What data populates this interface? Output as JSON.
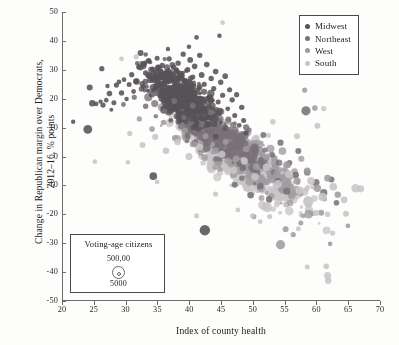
{
  "chart_data": {
    "type": "scatter",
    "title": "",
    "xlabel": "Index of county health",
    "ylabel": "Change in Republican margin over Democrats,\n2012–16, % points",
    "xlim": [
      20,
      70
    ],
    "ylim": [
      -50,
      50
    ],
    "xticks": [
      20,
      25,
      30,
      35,
      40,
      45,
      50,
      55,
      60,
      65,
      70
    ],
    "yticks": [
      50,
      40,
      30,
      20,
      10,
      0,
      -10,
      -20,
      -30,
      -40,
      -50
    ],
    "grid": false,
    "legend_position": "top-right",
    "size_encoding": {
      "label": "Voting-age citizens",
      "large_label": "500,00",
      "small_label": "5000",
      "large_value": 500000,
      "small_value": 5000
    },
    "series": [
      {
        "name": "Midwest",
        "color": "#575257",
        "n_points": 620
      },
      {
        "name": "Northeast",
        "color": "#787278",
        "n_points": 310
      },
      {
        "name": "West",
        "color": "#a09ba0",
        "n_points": 330
      },
      {
        "name": "South",
        "color": "#c8c5c6",
        "n_points": 740
      }
    ],
    "annotations": [
      {
        "text": "Dark Midwest outlier",
        "x": 42.3,
        "y": -25.5
      },
      {
        "text": "Light South outlier high",
        "x": 45.1,
        "y": 46.3
      },
      {
        "text": "Light South outliers low right",
        "x": 61.5,
        "y": -41.0
      }
    ],
    "points": [
      {
        "s": 0,
        "x": 21.6,
        "y": 12.0,
        "r": 2.2
      },
      {
        "s": 0,
        "x": 23.9,
        "y": 9.4,
        "r": 4.4
      },
      {
        "s": 0,
        "x": 24.2,
        "y": 23.9,
        "r": 3.0
      },
      {
        "s": 0,
        "x": 24.6,
        "y": 18.4,
        "r": 3.2
      },
      {
        "s": 0,
        "x": 25.2,
        "y": 18.2,
        "r": 2.4
      },
      {
        "s": 0,
        "x": 25.9,
        "y": 19.0,
        "r": 2.2
      },
      {
        "s": 0,
        "x": 26.3,
        "y": 17.8,
        "r": 2.6
      },
      {
        "s": 0,
        "x": 26.8,
        "y": 19.5,
        "r": 2.3
      },
      {
        "s": 0,
        "x": 27.3,
        "y": 21.8,
        "r": 2.8
      },
      {
        "s": 0,
        "x": 27.6,
        "y": 16.2,
        "r": 2.0
      },
      {
        "s": 0,
        "x": 28.0,
        "y": 18.6,
        "r": 2.5
      },
      {
        "s": 0,
        "x": 28.4,
        "y": 24.7,
        "r": 2.6
      },
      {
        "s": 0,
        "x": 26.1,
        "y": 30.4,
        "r": 2.6
      },
      {
        "s": 0,
        "x": 27.0,
        "y": 24.4,
        "r": 2.2
      },
      {
        "s": 0,
        "x": 28.8,
        "y": 25.8,
        "r": 2.4
      },
      {
        "s": 0,
        "x": 29.2,
        "y": 22.0,
        "r": 2.7
      },
      {
        "s": 0,
        "x": 29.6,
        "y": 26.6,
        "r": 2.3
      },
      {
        "s": 0,
        "x": 30.0,
        "y": 19.9,
        "r": 2.2
      },
      {
        "s": 0,
        "x": 30.4,
        "y": 24.9,
        "r": 2.5
      },
      {
        "s": 0,
        "x": 30.8,
        "y": 28.3,
        "r": 2.6
      },
      {
        "s": 0,
        "x": 31.1,
        "y": 22.5,
        "r": 2.4
      },
      {
        "s": 0,
        "x": 31.5,
        "y": 26.0,
        "r": 2.8
      },
      {
        "s": 0,
        "x": 31.9,
        "y": 31.0,
        "r": 2.5
      },
      {
        "s": 0,
        "x": 32.2,
        "y": 35.8,
        "r": 3.0
      },
      {
        "s": 0,
        "x": 32.6,
        "y": 24.2,
        "r": 2.5
      },
      {
        "s": 0,
        "x": 33.0,
        "y": 28.9,
        "r": 2.7
      },
      {
        "s": 0,
        "x": 33.4,
        "y": 33.1,
        "r": 2.6
      },
      {
        "s": 0,
        "x": 33.7,
        "y": 26.4,
        "r": 2.9
      },
      {
        "s": 0,
        "x": 34.1,
        "y": 30.2,
        "r": 2.6
      },
      {
        "s": 0,
        "x": 34.5,
        "y": 22.7,
        "r": 2.4
      },
      {
        "s": 0,
        "x": 34.8,
        "y": 34.0,
        "r": 2.5
      },
      {
        "s": 0,
        "x": 35.2,
        "y": 28.0,
        "r": 2.8
      },
      {
        "s": 0,
        "x": 35.6,
        "y": 31.5,
        "r": 2.7
      },
      {
        "s": 0,
        "x": 35.9,
        "y": 25.3,
        "r": 2.6
      },
      {
        "s": 0,
        "x": 36.3,
        "y": 29.1,
        "r": 2.9
      },
      {
        "s": 0,
        "x": 36.7,
        "y": 33.8,
        "r": 2.6
      },
      {
        "s": 0,
        "x": 37.0,
        "y": 27.2,
        "r": 2.7
      },
      {
        "s": 0,
        "x": 37.4,
        "y": 30.9,
        "r": 2.8
      },
      {
        "s": 0,
        "x": 37.8,
        "y": 24.0,
        "r": 2.5
      },
      {
        "s": 0,
        "x": 38.1,
        "y": 32.3,
        "r": 2.7
      },
      {
        "s": 0,
        "x": 38.5,
        "y": 28.6,
        "r": 3.0
      },
      {
        "s": 0,
        "x": 38.9,
        "y": 35.4,
        "r": 2.6
      },
      {
        "s": 0,
        "x": 39.2,
        "y": 26.1,
        "r": 2.8
      },
      {
        "s": 0,
        "x": 39.6,
        "y": 30.0,
        "r": 2.7
      },
      {
        "s": 0,
        "x": 40.0,
        "y": 33.4,
        "r": 2.9
      },
      {
        "s": 0,
        "x": 40.4,
        "y": 27.5,
        "r": 2.6
      },
      {
        "s": 0,
        "x": 40.7,
        "y": 31.2,
        "r": 2.8
      },
      {
        "s": 0,
        "x": 41.1,
        "y": 22.9,
        "r": 2.5
      },
      {
        "s": 0,
        "x": 41.5,
        "y": 35.0,
        "r": 2.7
      },
      {
        "s": 0,
        "x": 41.8,
        "y": 28.2,
        "r": 2.9
      },
      {
        "s": 0,
        "x": 42.2,
        "y": 25.0,
        "r": 2.6
      },
      {
        "s": 0,
        "x": 42.6,
        "y": 31.8,
        "r": 2.8
      },
      {
        "s": 0,
        "x": 42.9,
        "y": 20.4,
        "r": 2.5
      },
      {
        "s": 0,
        "x": 43.3,
        "y": 27.0,
        "r": 2.7
      },
      {
        "s": 0,
        "x": 43.7,
        "y": 23.5,
        "r": 2.6
      },
      {
        "s": 0,
        "x": 44.0,
        "y": 29.4,
        "r": 2.8
      },
      {
        "s": 0,
        "x": 44.4,
        "y": 18.9,
        "r": 2.5
      },
      {
        "s": 0,
        "x": 44.8,
        "y": 25.7,
        "r": 2.7
      },
      {
        "s": 0,
        "x": 45.1,
        "y": 21.2,
        "r": 2.6
      },
      {
        "s": 0,
        "x": 45.5,
        "y": 27.8,
        "r": 2.8
      },
      {
        "s": 0,
        "x": 45.9,
        "y": 16.5,
        "r": 2.4
      },
      {
        "s": 0,
        "x": 46.2,
        "y": 23.1,
        "r": 2.6
      },
      {
        "s": 0,
        "x": 46.6,
        "y": 19.6,
        "r": 2.7
      },
      {
        "s": 0,
        "x": 47.0,
        "y": 14.2,
        "r": 2.5
      },
      {
        "s": 0,
        "x": 47.3,
        "y": 21.4,
        "r": 2.6
      },
      {
        "s": 0,
        "x": 47.7,
        "y": 10.8,
        "r": 2.4
      },
      {
        "s": 0,
        "x": 48.1,
        "y": 17.0,
        "r": 2.7
      },
      {
        "s": 0,
        "x": 48.4,
        "y": 12.5,
        "r": 2.5
      },
      {
        "s": 0,
        "x": 48.8,
        "y": 8.2,
        "r": 2.6
      },
      {
        "s": 0,
        "x": 42.3,
        "y": -25.5,
        "r": 5.2
      },
      {
        "s": 0,
        "x": 34.2,
        "y": -6.8,
        "r": 3.8
      },
      {
        "s": 0,
        "x": 41.0,
        "y": 41.2,
        "r": 2.4
      },
      {
        "s": 0,
        "x": 44.6,
        "y": 41.8,
        "r": 2.3
      },
      {
        "s": 0,
        "x": 39.8,
        "y": 38.0,
        "r": 2.3
      },
      {
        "s": 0,
        "x": 36.5,
        "y": 37.2,
        "r": 2.2
      },
      {
        "s": 1,
        "x": 29.5,
        "y": 18.0,
        "r": 2.4
      },
      {
        "s": 1,
        "x": 31.2,
        "y": 20.5,
        "r": 2.6
      },
      {
        "s": 1,
        "x": 33.0,
        "y": 17.4,
        "r": 2.7
      },
      {
        "s": 1,
        "x": 34.6,
        "y": 21.9,
        "r": 2.8
      },
      {
        "s": 1,
        "x": 36.0,
        "y": 15.8,
        "r": 2.6
      },
      {
        "s": 1,
        "x": 37.5,
        "y": 19.2,
        "r": 2.9
      },
      {
        "s": 1,
        "x": 39.0,
        "y": 13.5,
        "r": 2.7
      },
      {
        "s": 1,
        "x": 40.4,
        "y": 17.6,
        "r": 3.0
      },
      {
        "s": 1,
        "x": 41.8,
        "y": 11.0,
        "r": 2.8
      },
      {
        "s": 1,
        "x": 43.2,
        "y": 15.3,
        "r": 2.9
      },
      {
        "s": 1,
        "x": 44.6,
        "y": 8.4,
        "r": 2.7
      },
      {
        "s": 1,
        "x": 46.0,
        "y": 12.8,
        "r": 3.0
      },
      {
        "s": 1,
        "x": 47.4,
        "y": 5.9,
        "r": 2.8
      },
      {
        "s": 1,
        "x": 48.8,
        "y": 10.1,
        "r": 3.1
      },
      {
        "s": 1,
        "x": 50.2,
        "y": 3.2,
        "r": 2.9
      },
      {
        "s": 1,
        "x": 51.5,
        "y": 7.4,
        "r": 3.0
      },
      {
        "s": 1,
        "x": 52.9,
        "y": 0.6,
        "r": 2.8
      },
      {
        "s": 1,
        "x": 54.2,
        "y": 4.8,
        "r": 3.1
      },
      {
        "s": 1,
        "x": 55.6,
        "y": -2.2,
        "r": 2.9
      },
      {
        "s": 1,
        "x": 57.0,
        "y": 1.9,
        "r": 3.0
      },
      {
        "s": 1,
        "x": 58.2,
        "y": 15.8,
        "r": 4.6
      },
      {
        "s": 1,
        "x": 58.4,
        "y": -5.5,
        "r": 3.2
      },
      {
        "s": 1,
        "x": 59.8,
        "y": -9.0,
        "r": 3.4
      },
      {
        "s": 1,
        "x": 61.0,
        "y": -12.5,
        "r": 3.6
      },
      {
        "s": 1,
        "x": 62.2,
        "y": -8.0,
        "r": 3.0
      },
      {
        "s": 1,
        "x": 63.0,
        "y": -16.0,
        "r": 2.8
      },
      {
        "s": 1,
        "x": 49.5,
        "y": -13.4,
        "r": 3.3
      },
      {
        "s": 1,
        "x": 51.0,
        "y": -10.2,
        "r": 3.4
      },
      {
        "s": 1,
        "x": 52.4,
        "y": -14.8,
        "r": 3.2
      },
      {
        "s": 1,
        "x": 53.8,
        "y": -8.6,
        "r": 3.3
      },
      {
        "s": 1,
        "x": 55.2,
        "y": -12.0,
        "r": 3.5
      },
      {
        "s": 1,
        "x": 56.6,
        "y": -6.4,
        "r": 3.2
      },
      {
        "s": 1,
        "x": 47.0,
        "y": -9.8,
        "r": 3.0
      },
      {
        "s": 2,
        "x": 32.0,
        "y": 13.0,
        "r": 2.6
      },
      {
        "s": 2,
        "x": 34.0,
        "y": 9.5,
        "r": 2.8
      },
      {
        "s": 2,
        "x": 35.8,
        "y": 11.8,
        "r": 2.7
      },
      {
        "s": 2,
        "x": 37.6,
        "y": 6.4,
        "r": 3.0
      },
      {
        "s": 2,
        "x": 39.2,
        "y": 9.0,
        "r": 2.9
      },
      {
        "s": 2,
        "x": 40.8,
        "y": 4.2,
        "r": 3.1
      },
      {
        "s": 2,
        "x": 42.4,
        "y": 7.0,
        "r": 3.0
      },
      {
        "s": 2,
        "x": 44.0,
        "y": 2.0,
        "r": 3.2
      },
      {
        "s": 2,
        "x": 45.6,
        "y": 5.1,
        "r": 3.1
      },
      {
        "s": 2,
        "x": 47.2,
        "y": -0.8,
        "r": 3.3
      },
      {
        "s": 2,
        "x": 48.8,
        "y": 2.6,
        "r": 3.2
      },
      {
        "s": 2,
        "x": 50.4,
        "y": -3.5,
        "r": 3.4
      },
      {
        "s": 2,
        "x": 52.0,
        "y": -0.2,
        "r": 3.3
      },
      {
        "s": 2,
        "x": 53.6,
        "y": -6.0,
        "r": 3.5
      },
      {
        "s": 2,
        "x": 55.2,
        "y": -2.8,
        "r": 3.4
      },
      {
        "s": 2,
        "x": 56.8,
        "y": -8.5,
        "r": 3.6
      },
      {
        "s": 2,
        "x": 58.4,
        "y": -5.0,
        "r": 3.5
      },
      {
        "s": 2,
        "x": 60.0,
        "y": -11.0,
        "r": 3.7
      },
      {
        "s": 2,
        "x": 61.6,
        "y": -7.5,
        "r": 3.4
      },
      {
        "s": 2,
        "x": 63.2,
        "y": -13.2,
        "r": 3.2
      },
      {
        "s": 2,
        "x": 58.0,
        "y": 23.0,
        "r": 2.6
      },
      {
        "s": 2,
        "x": 59.6,
        "y": 16.8,
        "r": 2.8
      },
      {
        "s": 2,
        "x": 54.2,
        "y": -30.5,
        "r": 4.6
      },
      {
        "s": 2,
        "x": 55.0,
        "y": -25.2,
        "r": 3.0
      },
      {
        "s": 2,
        "x": 56.2,
        "y": -27.0,
        "r": 2.6
      },
      {
        "s": 2,
        "x": 57.4,
        "y": -23.0,
        "r": 2.5
      },
      {
        "s": 2,
        "x": 50.0,
        "y": -20.8,
        "r": 2.6
      },
      {
        "s": 2,
        "x": 62.0,
        "y": -30.2,
        "r": 2.4
      },
      {
        "s": 2,
        "x": 60.6,
        "y": -19.5,
        "r": 3.0
      },
      {
        "s": 2,
        "x": 64.8,
        "y": -24.0,
        "r": 2.4
      },
      {
        "s": 3,
        "x": 30.5,
        "y": 8.0,
        "r": 2.6
      },
      {
        "s": 3,
        "x": 32.5,
        "y": 4.0,
        "r": 2.9
      },
      {
        "s": 3,
        "x": 34.5,
        "y": 6.8,
        "r": 3.1
      },
      {
        "s": 3,
        "x": 36.2,
        "y": 2.0,
        "r": 3.3
      },
      {
        "s": 3,
        "x": 38.0,
        "y": 5.0,
        "r": 3.2
      },
      {
        "s": 3,
        "x": 39.8,
        "y": 0.0,
        "r": 3.5
      },
      {
        "s": 3,
        "x": 41.5,
        "y": 3.2,
        "r": 3.4
      },
      {
        "s": 3,
        "x": 43.2,
        "y": -2.5,
        "r": 3.6
      },
      {
        "s": 3,
        "x": 45.0,
        "y": 0.8,
        "r": 3.5
      },
      {
        "s": 3,
        "x": 46.8,
        "y": -4.8,
        "r": 3.7
      },
      {
        "s": 3,
        "x": 48.5,
        "y": -1.5,
        "r": 3.6
      },
      {
        "s": 3,
        "x": 50.2,
        "y": -7.0,
        "r": 3.8
      },
      {
        "s": 3,
        "x": 52.0,
        "y": -3.8,
        "r": 3.7
      },
      {
        "s": 3,
        "x": 53.8,
        "y": -9.5,
        "r": 3.9
      },
      {
        "s": 3,
        "x": 55.5,
        "y": -6.2,
        "r": 3.8
      },
      {
        "s": 3,
        "x": 57.2,
        "y": -11.8,
        "r": 4.0
      },
      {
        "s": 3,
        "x": 59.0,
        "y": -8.4,
        "r": 3.9
      },
      {
        "s": 3,
        "x": 60.8,
        "y": -14.0,
        "r": 4.1
      },
      {
        "s": 3,
        "x": 62.5,
        "y": -10.5,
        "r": 3.8
      },
      {
        "s": 3,
        "x": 64.2,
        "y": -15.0,
        "r": 3.4
      },
      {
        "s": 3,
        "x": 66.0,
        "y": -11.0,
        "r": 4.2
      },
      {
        "s": 3,
        "x": 66.8,
        "y": -11.2,
        "r": 3.6
      },
      {
        "s": 3,
        "x": 45.1,
        "y": 46.3,
        "r": 2.4
      },
      {
        "s": 3,
        "x": 31.5,
        "y": 34.5,
        "r": 2.6
      },
      {
        "s": 3,
        "x": 29.2,
        "y": 33.8,
        "r": 2.4
      },
      {
        "s": 3,
        "x": 61.4,
        "y": -38.0,
        "r": 2.8
      },
      {
        "s": 3,
        "x": 61.6,
        "y": -41.2,
        "r": 3.6
      },
      {
        "s": 3,
        "x": 61.7,
        "y": -43.0,
        "r": 3.2
      },
      {
        "s": 3,
        "x": 58.4,
        "y": -38.2,
        "r": 2.5
      },
      {
        "s": 3,
        "x": 59.8,
        "y": -19.5,
        "r": 3.2
      },
      {
        "s": 3,
        "x": 61.6,
        "y": -20.0,
        "r": 2.8
      },
      {
        "s": 3,
        "x": 47.5,
        "y": -18.5,
        "r": 2.4
      },
      {
        "s": 3,
        "x": 49.8,
        "y": -20.5,
        "r": 2.5
      },
      {
        "s": 3,
        "x": 25.0,
        "y": -1.8,
        "r": 2.4
      },
      {
        "s": 3,
        "x": 30.2,
        "y": -2.0,
        "r": 2.3
      },
      {
        "s": 3,
        "x": 34.8,
        "y": -8.8,
        "r": 2.4
      },
      {
        "s": 3,
        "x": 41.0,
        "y": -20.5,
        "r": 2.6
      },
      {
        "s": 3,
        "x": 55.0,
        "y": -16.8,
        "r": 2.4
      },
      {
        "s": 3,
        "x": 52.5,
        "y": -20.8,
        "r": 2.6
      },
      {
        "s": 3,
        "x": 64.5,
        "y": -19.8,
        "r": 3.0
      },
      {
        "s": 3,
        "x": 57.0,
        "y": -25.0,
        "r": 2.5
      },
      {
        "s": 3,
        "x": 51.0,
        "y": -22.5,
        "r": 2.4
      },
      {
        "s": 3,
        "x": 44.0,
        "y": -13.0,
        "r": 2.6
      },
      {
        "s": 3,
        "x": 62.4,
        "y": -26.5,
        "r": 2.6
      },
      {
        "s": 3,
        "x": 60.0,
        "y": 10.6,
        "r": 3.0
      },
      {
        "s": 3,
        "x": 61.0,
        "y": 16.6,
        "r": 2.6
      },
      {
        "s": 3,
        "x": 56.8,
        "y": 7.0,
        "r": 3.0
      },
      {
        "s": 3,
        "x": 53.0,
        "y": 12.0,
        "r": 2.8
      }
    ]
  },
  "legend": {
    "items": [
      {
        "label": "Midwest",
        "color": "#575257"
      },
      {
        "label": "Northeast",
        "color": "#787278"
      },
      {
        "label": "West",
        "color": "#a09ba0"
      },
      {
        "label": "South",
        "color": "#c8c5c6"
      }
    ]
  },
  "size_legend": {
    "title": "Voting-age citizens",
    "large": "500,00",
    "small": "5000"
  },
  "axes": {
    "x_title": "Index of county health",
    "y_title": "Change in Republican margin over Democrats,\n2012–16, % points",
    "x_ticks": [
      "20",
      "25",
      "30",
      "35",
      "40",
      "45",
      "50",
      "55",
      "60",
      "65",
      "70"
    ],
    "y_ticks": [
      "50",
      "40",
      "30",
      "20",
      "10",
      "0",
      "-10",
      "-20",
      "-30",
      "-40",
      "-50"
    ]
  }
}
